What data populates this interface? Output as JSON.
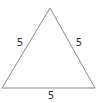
{
  "diagram": {
    "shape": "equilateral-triangle",
    "stroke_color": "#8a8a8a",
    "label_color": "#333333",
    "sides": {
      "left": "5",
      "right": "5",
      "bottom": "5"
    }
  }
}
